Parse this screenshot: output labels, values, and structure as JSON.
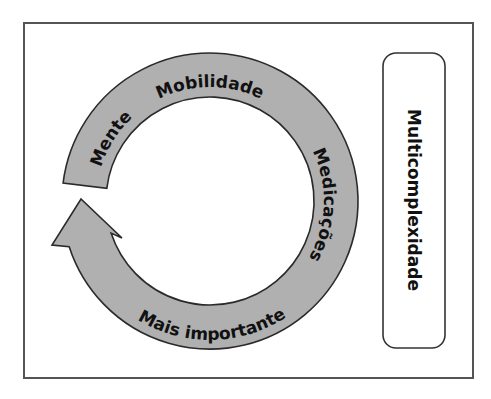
{
  "diagram": {
    "type": "cycle-arrow",
    "cycle_labels": [
      {
        "id": "mente",
        "text": "Mente"
      },
      {
        "id": "mobilidade",
        "text": "Mobilidade"
      },
      {
        "id": "medicacoes",
        "text": "Medicações"
      },
      {
        "id": "mais_importante",
        "text": "Mais importante"
      }
    ],
    "side_box": {
      "text": "Multicomplexidade"
    },
    "colors": {
      "arrow_fill": "#b0b0b0",
      "arrow_stroke": "#2a2a2a",
      "frame_stroke": "#555555",
      "text": "#111111"
    }
  }
}
